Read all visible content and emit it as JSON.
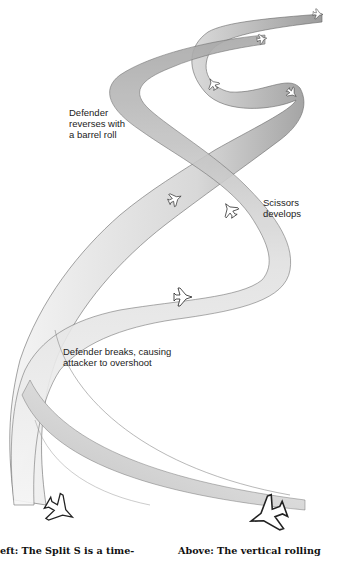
{
  "diagram": {
    "type": "air-combat maneuver illustration",
    "labels": {
      "barrel_roll": "Defender\nreverses with\na barrel roll",
      "scissors": "Scissors\ndevelops",
      "break": "Defender breaks, causing\nattacker to overshoot"
    },
    "captions": {
      "left": "eft: The Split S is a time-",
      "right": "Above: The vertical rolling"
    },
    "colors": {
      "ribbon_fill": "#e6e6e6",
      "ribbon_shade": "#9a9a9a",
      "outline": "#555555",
      "text": "#222222",
      "background": "#ffffff"
    },
    "aircraft": [
      {
        "id": "jet-top-right",
        "x": 318,
        "y": 14
      },
      {
        "id": "jet-top-mid",
        "x": 262,
        "y": 39
      },
      {
        "id": "jet-upper-left",
        "x": 213,
        "y": 84
      },
      {
        "id": "jet-upper-right",
        "x": 292,
        "y": 93
      },
      {
        "id": "jet-mid-left",
        "x": 175,
        "y": 199
      },
      {
        "id": "jet-mid-right",
        "x": 230,
        "y": 210
      },
      {
        "id": "jet-lower",
        "x": 183,
        "y": 297
      },
      {
        "id": "jet-bottom-left",
        "x": 60,
        "y": 510
      },
      {
        "id": "jet-bottom-right",
        "x": 268,
        "y": 515
      }
    ]
  }
}
